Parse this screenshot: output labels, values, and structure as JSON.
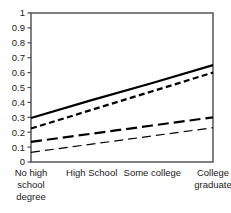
{
  "chart_data": {
    "type": "line",
    "title": "",
    "subtitle": "",
    "xlabel": "",
    "ylabel": "",
    "categories": [
      "No high school degree",
      "High School",
      "Some college",
      "College graduate"
    ],
    "x": [
      0,
      1,
      2,
      3
    ],
    "ylim": [
      0,
      1
    ],
    "xlim": [
      0,
      3
    ],
    "grid": false,
    "legend": "none",
    "ytick_labels": [
      "0",
      "0.1",
      "0.2",
      "0.3",
      "0.4",
      "0.5",
      "0.6",
      "0.7",
      "0.8",
      "0.9",
      "1"
    ],
    "ytick_values": [
      0,
      0.1,
      0.2,
      0.3,
      0.4,
      0.5,
      0.6,
      0.7,
      0.8,
      0.9,
      1
    ],
    "xtick_labels_wrapped": [
      [
        "No high",
        "school",
        "degree"
      ],
      [
        "High School"
      ],
      [
        "Some college"
      ],
      [
        "College",
        "graduate"
      ]
    ],
    "series": [
      {
        "name": "series-1-solid-thick",
        "style": "solid",
        "width": 2.2,
        "color": "#000000",
        "values": [
          0.295,
          0.415,
          0.53,
          0.65
        ]
      },
      {
        "name": "series-2-short-dash-thick",
        "style": "short-dash",
        "width": 2.2,
        "color": "#000000",
        "values": [
          0.225,
          0.35,
          0.475,
          0.6
        ]
      },
      {
        "name": "series-3-long-dash-thick",
        "style": "long-dash",
        "width": 2.2,
        "color": "#000000",
        "values": [
          0.135,
          0.19,
          0.245,
          0.3
        ]
      },
      {
        "name": "series-4-long-dash-thin",
        "style": "long-dash-thin",
        "width": 1.2,
        "color": "#000000",
        "values": [
          0.065,
          0.12,
          0.175,
          0.23
        ]
      }
    ]
  },
  "axes": {
    "y_axis_name": "y-axis",
    "x_axis_name": "x-axis"
  }
}
